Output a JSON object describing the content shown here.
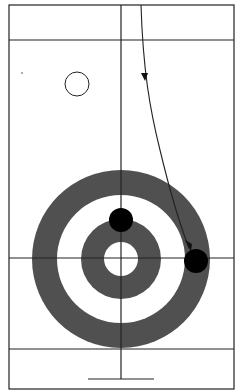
{
  "diagram": {
    "colors": {
      "ring": "#505050",
      "line": "#222222",
      "stone": "#000000",
      "background": "#ffffff"
    },
    "house_center": {
      "x": 121,
      "y": 259
    },
    "rings_radii": [
      89,
      64,
      40,
      17
    ],
    "stones": [
      {
        "name": "stone-on-center-line",
        "x": 121,
        "y": 220,
        "r": 12
      },
      {
        "name": "stone-delivered",
        "x": 196,
        "y": 261,
        "r": 12
      }
    ],
    "path": "curved delivery path with arrows"
  }
}
